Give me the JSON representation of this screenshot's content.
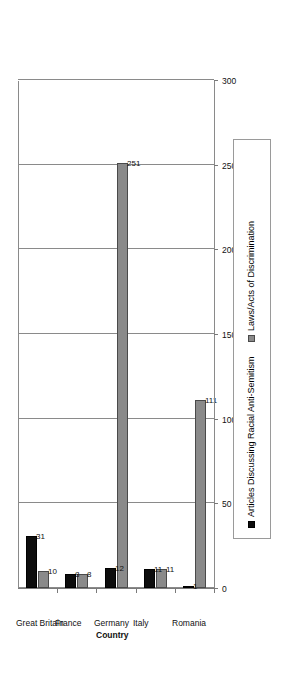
{
  "chart_data": {
    "type": "bar",
    "orientation": "vertical-rendered-rotated",
    "title": "",
    "xlabel": "Country",
    "ylabel": "Frequency",
    "ylim": [
      0,
      300
    ],
    "yticks": [
      0,
      50,
      100,
      150,
      200,
      250,
      300
    ],
    "ytick_labels": [
      "0",
      "50",
      "100",
      "150",
      "200",
      "250",
      "300"
    ],
    "grid": true,
    "legend_position": "bottom-right",
    "categories": [
      "Great Britain",
      "France",
      "Germany",
      "Italy",
      "Romania"
    ],
    "series": [
      {
        "name": "Articles Discussing Racial Anti-Semitism",
        "color": "#0d0d0d",
        "values": [
          31,
          8,
          12,
          11,
          1
        ],
        "labels": [
          "31",
          "8",
          "12",
          "11",
          "1"
        ]
      },
      {
        "name": "Laws/Acts of Discrimination",
        "color": "#8a8a8a",
        "values": [
          10,
          8,
          251,
          11,
          111
        ],
        "labels": [
          "10",
          "8",
          "251",
          "11",
          "111"
        ]
      }
    ]
  },
  "axes": {
    "value_axis_title": "Frequency",
    "category_axis_title": "Country",
    "tick_labels": [
      "300",
      "250",
      "200",
      "150",
      "100",
      "50",
      "0"
    ]
  },
  "legend": {
    "items": [
      {
        "label": "Articles Discussing Racial Anti-Semitism",
        "swatch": "#0d0d0d"
      },
      {
        "label": "Laws/Acts of Discrimination",
        "swatch": "#8a8a8a"
      }
    ]
  }
}
